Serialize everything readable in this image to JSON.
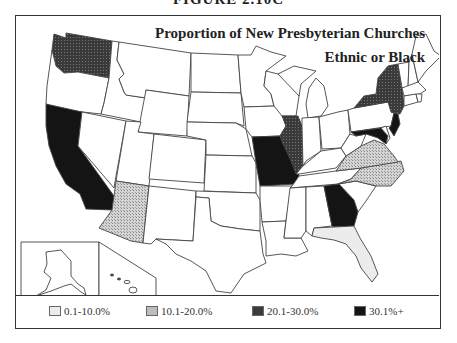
{
  "figure_label": "FIGURE 2.10C",
  "map": {
    "title_line1": "Proportion of  New Presbyterian Churches",
    "title_line2": "Ethnic or Black",
    "insets": [
      "Alaska",
      "Hawaii"
    ]
  },
  "colors": {
    "cat1": "#efefef",
    "cat2": "#bdbdbd",
    "cat3": "#3c3c3c",
    "cat4": "#141414",
    "outline": "#444444"
  },
  "legend": {
    "items": [
      {
        "label": "0.1-10.0%",
        "category": "cat1"
      },
      {
        "label": "10.1-20.0%",
        "category": "cat2"
      },
      {
        "label": "20.1-30.0%",
        "category": "cat3"
      },
      {
        "label": "30.1%+",
        "category": "cat4"
      }
    ]
  },
  "shaded_states": {
    "0.1-10.0%": [
      "Florida"
    ],
    "10.1-20.0%": [
      "Arizona",
      "Virginia",
      "North Carolina"
    ],
    "20.1-30.0%": [
      "Washington",
      "Illinois",
      "New York"
    ],
    "30.1%+": [
      "California",
      "Missouri",
      "Georgia",
      "New Jersey",
      "Maryland"
    ]
  }
}
